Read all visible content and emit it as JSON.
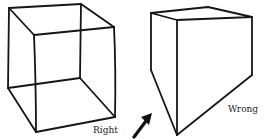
{
  "figures": [
    {
      "id": "correct-cube",
      "label": "Right",
      "description": "Wireframe cube drawn with correct perspective"
    },
    {
      "id": "incorrect-box",
      "label": "Wrong",
      "description": "Box drawn with distorted, incorrect perspective; bottom converges to a point"
    }
  ],
  "arrow": {
    "icon": "arrow-up-right-icon",
    "points_to": "incorrect-box bottom vertex"
  },
  "colors": {
    "line": "#151515",
    "background": "#ffffff"
  }
}
